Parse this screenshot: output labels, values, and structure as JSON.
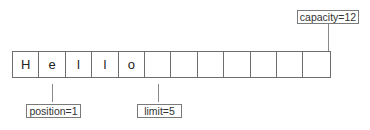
{
  "buffer": {
    "cells": [
      "H",
      "e",
      "l",
      "l",
      "o",
      "",
      "",
      "",
      "",
      "",
      "",
      ""
    ]
  },
  "markers": {
    "capacity": "capacity=12",
    "position": "position=1",
    "limit": "limit=5"
  }
}
